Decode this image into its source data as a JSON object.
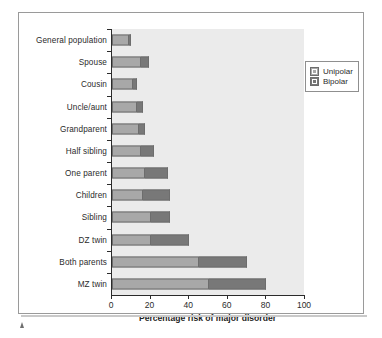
{
  "chart_data": {
    "type": "bar",
    "orientation": "horizontal",
    "stacked": true,
    "title": "",
    "xlabel": "Percentage risk of major disorder",
    "ylabel": "",
    "xlim": [
      0,
      100
    ],
    "xticks": [
      0,
      20,
      40,
      60,
      80,
      100
    ],
    "grid": false,
    "legend_position": "upper right",
    "categories": [
      "General population",
      "Spouse",
      "Cousin",
      "Uncle/aunt",
      "Grandparent",
      "Half  sibling",
      "One parent",
      "Children",
      "Sibling",
      "DZ twin",
      "Both parents",
      "MZ twin"
    ],
    "series": [
      {
        "name": "Unipolar",
        "color": "#a8a8a8",
        "values": [
          9,
          15,
          11,
          13,
          14,
          15,
          17,
          16,
          20,
          20,
          45,
          50
        ]
      },
      {
        "name": "Bipolar",
        "color": "#787878",
        "values": [
          1,
          4,
          2,
          3,
          3,
          7,
          12,
          14,
          10,
          20,
          25,
          30
        ]
      }
    ],
    "totals": [
      10,
      19,
      13,
      16,
      17,
      22,
      29,
      30,
      30,
      40,
      70,
      80
    ]
  },
  "legend": {
    "items": [
      {
        "label": "Unipolar",
        "color": "#a8a8a8"
      },
      {
        "label": "Bipolar",
        "color": "#787878"
      }
    ]
  },
  "axis": {
    "x_title": "Percentage risk of major disorder",
    "x_tick_labels": [
      "0",
      "20",
      "40",
      "60",
      "80",
      "100"
    ]
  },
  "colors": {
    "plot_background": "#ebebeb",
    "frame_border": "#9a9a9a",
    "axis_line": "#2b2b2b",
    "unipolar": "#a8a8a8",
    "bipolar": "#787878"
  }
}
